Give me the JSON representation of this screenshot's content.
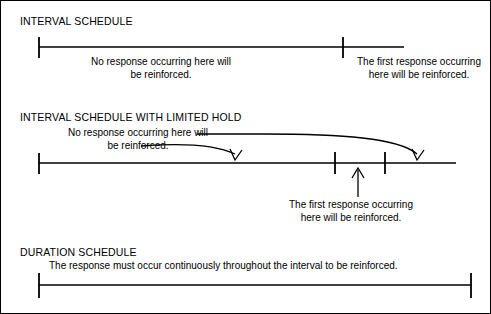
{
  "figure": {
    "background_color": "#ffffff",
    "line_color": "#000000",
    "border_color": "#000000"
  },
  "sections": [
    {
      "id": "interval-schedule",
      "heading": "INTERVAL SCHEDULE",
      "captions": {
        "left": "No response occurring here will\nbe reinforced.",
        "left_line1": "No response occurring here will",
        "left_line2": "be reinforced.",
        "right": "The first response occurring\nhere will be reinforced.",
        "right_line1": "The first response occurring",
        "right_line2": "here will be reinforced."
      },
      "timeline": {
        "start_x": 38,
        "end_x": 403,
        "y": 46,
        "ticks": [
          38,
          342
        ]
      }
    },
    {
      "id": "interval-schedule-with-limited-hold",
      "heading": "INTERVAL SCHEDULE WITH LIMITED HOLD",
      "captions": {
        "left_line1": "No response occurring here will",
        "left_line2": "be reinforced.",
        "bottom_line1": "The first response occurring",
        "bottom_line2": "here will be reinforced."
      },
      "timeline": {
        "start_x": 38,
        "end_x": 455,
        "y": 162,
        "ticks": [
          38,
          334,
          384
        ]
      },
      "arrows": [
        {
          "name": "short-curve-to-no-response-zone",
          "from_x": 175,
          "from_y": 145,
          "to_x": 237,
          "to_y": 157
        },
        {
          "name": "long-curve-to-limited-hold-zone",
          "from_x": 230,
          "from_y": 133,
          "to_x": 418,
          "to_y": 157
        },
        {
          "name": "up-arrow-to-first-response",
          "from_x": 357,
          "from_y": 196,
          "to_x": 357,
          "to_y": 166
        }
      ]
    },
    {
      "id": "duration-schedule",
      "heading": "DURATION SCHEDULE",
      "captions": {
        "main": "The response must occur continuously throughout the interval to be reinforced."
      },
      "timeline": {
        "start_x": 38,
        "end_x": 470,
        "y": 284,
        "ticks": [
          38,
          470
        ]
      }
    }
  ]
}
